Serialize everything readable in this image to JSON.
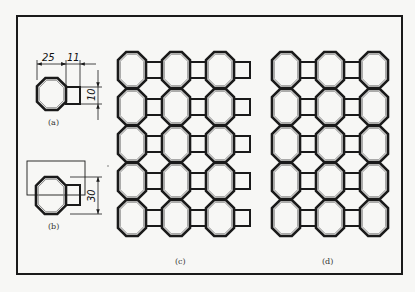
{
  "figure": {
    "captions": {
      "a": "(a)",
      "b": "(b)",
      "c": "(c)",
      "d": "(d)"
    },
    "dimensions": {
      "octagon_width": "25",
      "square_offset": "11",
      "square_height": "10",
      "pitch": "30"
    },
    "colors": {
      "line": "#1a1a1a",
      "inner_line": "#888888",
      "background": "#f7f7f5"
    },
    "pattern_c": {
      "rows": 5,
      "columns": 3,
      "squares_per_row": 3,
      "description": "octagons with square to the right of each octagon"
    },
    "pattern_d": {
      "rows": 5,
      "columns": 3,
      "squares_per_row": 2,
      "description": "octagons with squares only between octagons"
    }
  }
}
